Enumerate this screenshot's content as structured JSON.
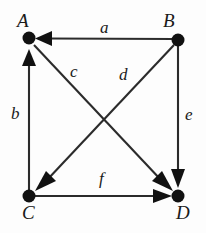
{
  "diagram": {
    "type": "directed-graph",
    "background_color": "#fdfdfd",
    "stroke_color": "#2b2b2b",
    "node_color": "#111111",
    "nodes": [
      {
        "id": "A",
        "label": "A",
        "x": 29,
        "y": 38
      },
      {
        "id": "B",
        "label": "B",
        "x": 178,
        "y": 40
      },
      {
        "id": "C",
        "label": "C",
        "x": 29,
        "y": 196
      },
      {
        "id": "D",
        "label": "D",
        "x": 178,
        "y": 196
      }
    ],
    "edges": [
      {
        "id": "a",
        "label": "a",
        "from": "B",
        "to": "A",
        "arrow_at": "A"
      },
      {
        "id": "b",
        "label": "b",
        "from": "C",
        "to": "A",
        "arrow_at": "A"
      },
      {
        "id": "c",
        "label": "c",
        "from": "B",
        "to": "C",
        "arrow_at": "C"
      },
      {
        "id": "d",
        "label": "d",
        "from": "A",
        "to": "D",
        "arrow_at": "D"
      },
      {
        "id": "e",
        "label": "e",
        "from": "B",
        "to": "D",
        "arrow_at": "D"
      },
      {
        "id": "f",
        "label": "f",
        "from": "C",
        "to": "D",
        "arrow_at": "D"
      }
    ]
  }
}
